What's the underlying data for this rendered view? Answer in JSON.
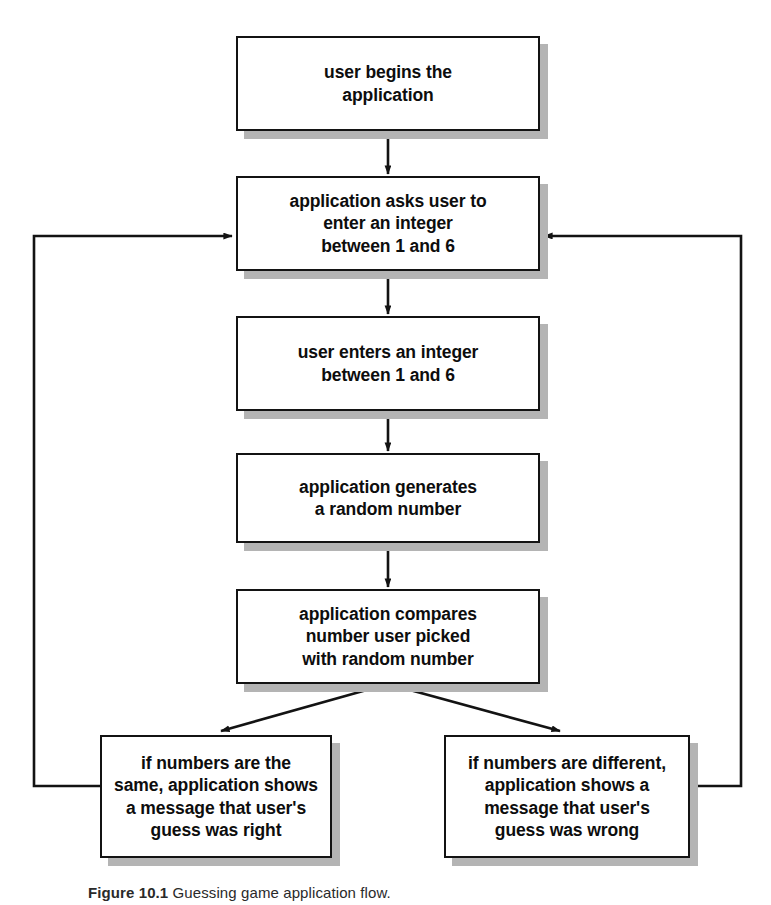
{
  "figure": {
    "type": "flowchart",
    "orientation": "top-to-bottom",
    "caption_label": "Figure 10.1",
    "caption_text": "Guessing game application flow.",
    "box_fill": "#ffffff",
    "box_border": "#131313",
    "shadow_color": "#b4b4b4",
    "line_color": "#131313",
    "text_color": "#0d0d0d"
  },
  "nodes": [
    {
      "id": "start",
      "label": "user begins the\napplication",
      "x": 236,
      "y": 36,
      "w": 304,
      "h": 95
    },
    {
      "id": "prompt",
      "label": "application asks user to\nenter an integer\nbetween 1 and 6",
      "x": 236,
      "y": 176,
      "w": 304,
      "h": 95
    },
    {
      "id": "input",
      "label": "user enters an integer\nbetween 1 and 6",
      "x": 236,
      "y": 316,
      "w": 304,
      "h": 95
    },
    {
      "id": "random",
      "label": "application generates\na random number",
      "x": 236,
      "y": 453,
      "w": 304,
      "h": 90
    },
    {
      "id": "compare",
      "label": "application compares\nnumber user picked\nwith random number",
      "x": 236,
      "y": 589,
      "w": 304,
      "h": 95
    },
    {
      "id": "right",
      "label": "if numbers are the\nsame, application shows\na message that user's\nguess was right",
      "x": 100,
      "y": 735,
      "w": 232,
      "h": 123
    },
    {
      "id": "wrong",
      "label": "if numbers are different,\napplication shows a\nmessage that user's\nguess was wrong",
      "x": 444,
      "y": 735,
      "w": 246,
      "h": 123
    }
  ],
  "connectors": [
    {
      "id": "start-to-prompt",
      "from": "start",
      "to": "prompt",
      "kind": "straight-arrow-down"
    },
    {
      "id": "prompt-to-input",
      "from": "prompt",
      "to": "input",
      "kind": "straight-arrow-down"
    },
    {
      "id": "input-to-random",
      "from": "input",
      "to": "random",
      "kind": "straight-arrow-down"
    },
    {
      "id": "random-to-compare",
      "from": "random",
      "to": "compare",
      "kind": "straight-arrow-down"
    },
    {
      "id": "compare-to-right",
      "from": "compare",
      "to": "right",
      "kind": "diagonal-arrow-down-left"
    },
    {
      "id": "compare-to-wrong",
      "from": "compare",
      "to": "wrong",
      "kind": "diagonal-arrow-down-right"
    },
    {
      "id": "right-loopback",
      "from": "right",
      "to": "prompt",
      "kind": "loop-left-arrow"
    },
    {
      "id": "wrong-loopback",
      "from": "wrong",
      "to": "prompt",
      "kind": "loop-right-arrow"
    }
  ]
}
